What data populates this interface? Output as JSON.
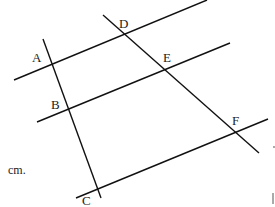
{
  "diagram": {
    "type": "geometry",
    "stroke_color": "#111111",
    "text_color": "#222222",
    "points": [
      {
        "name": "A",
        "label": "A",
        "x": 52,
        "y": 64,
        "label_x": 32,
        "label_y": 62
      },
      {
        "name": "B",
        "label": "B",
        "x": 68,
        "y": 108,
        "label_x": 51,
        "label_y": 109
      },
      {
        "name": "C",
        "label": "C",
        "x": 98,
        "y": 188,
        "label_x": 82,
        "label_y": 205
      },
      {
        "name": "D",
        "label": "D",
        "x": 124,
        "y": 33,
        "label_x": 119,
        "label_y": 28
      },
      {
        "name": "E",
        "label": "E",
        "x": 164,
        "y": 69,
        "label_x": 163,
        "label_y": 62
      },
      {
        "name": "F",
        "label": "F",
        "x": 236,
        "y": 131,
        "label_x": 232,
        "label_y": 125
      }
    ],
    "lines": [
      {
        "name": "parallel-line-AD",
        "x1": 14,
        "y1": 80,
        "x2": 207,
        "y2": 0
      },
      {
        "name": "parallel-line-BE",
        "x1": 37,
        "y1": 122,
        "x2": 230,
        "y2": 43
      },
      {
        "name": "parallel-line-CF",
        "x1": 76,
        "y1": 198,
        "x2": 268,
        "y2": 119
      },
      {
        "name": "transversal-ABC",
        "x1": 43,
        "y1": 39,
        "x2": 101,
        "y2": 198
      },
      {
        "name": "transversal-DEF",
        "x1": 103,
        "y1": 15,
        "x2": 259,
        "y2": 153
      }
    ],
    "side_text": {
      "label": "cm.",
      "x": 8,
      "y": 174
    },
    "edge_fragments": [
      {
        "name": "edge-mark-1",
        "x1": 273,
        "y1": 147,
        "x2": 275,
        "y2": 147
      },
      {
        "name": "edge-mark-2",
        "x1": 273,
        "y1": 193,
        "x2": 273,
        "y2": 204
      }
    ]
  }
}
